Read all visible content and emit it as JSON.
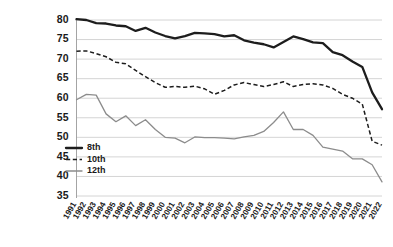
{
  "chart_data": {
    "type": "line",
    "title": "",
    "xlabel": "",
    "ylabel": "",
    "ylim": [
      35,
      80
    ],
    "ytick_step": 5,
    "grid": true,
    "legend_position": "bottom-left",
    "yticks": [
      80,
      75,
      70,
      65,
      60,
      55,
      50,
      45,
      40,
      35
    ],
    "categories": [
      "1991",
      "1992",
      "1993",
      "1994",
      "1995",
      "1996",
      "1997",
      "1998",
      "1999",
      "2000",
      "2001",
      "2002",
      "2003",
      "2004",
      "2005",
      "2006",
      "2007",
      "2008",
      "2009",
      "2010",
      "2011",
      "2012",
      "2013",
      "2014",
      "2015",
      "2016",
      "2017",
      "2018",
      "2019",
      "2020",
      "2021",
      "2022"
    ],
    "series": [
      {
        "name": "8th",
        "style": "solid-thick",
        "color": "#1d1d1d",
        "values": [
          80.2,
          80.0,
          79.2,
          79.1,
          78.6,
          78.4,
          77.2,
          78.0,
          76.8,
          75.9,
          75.3,
          75.9,
          76.7,
          76.6,
          76.4,
          75.8,
          76.1,
          74.8,
          74.2,
          73.8,
          73.0,
          74.4,
          75.8,
          75.1,
          74.3,
          74.1,
          71.8,
          71.0,
          69.4,
          68.0,
          61.5,
          57.2
        ]
      },
      {
        "name": "10th",
        "style": "dashed",
        "color": "#1d1d1d",
        "values": [
          72.0,
          72.1,
          71.4,
          70.6,
          69.2,
          68.8,
          67.1,
          65.5,
          64.0,
          62.8,
          63.0,
          62.8,
          63.1,
          62.4,
          61.0,
          62.0,
          63.4,
          64.0,
          63.5,
          63.0,
          63.5,
          64.2,
          63.0,
          63.5,
          63.7,
          63.4,
          62.5,
          61.0,
          60.0,
          58.5,
          49.0,
          48.0
        ]
      },
      {
        "name": "12th",
        "style": "solid-thin",
        "color": "#8c8c8c",
        "values": [
          59.6,
          61.0,
          60.8,
          56.0,
          54.0,
          55.5,
          53.0,
          54.5,
          52.0,
          50.0,
          49.8,
          48.6,
          50.1,
          49.9,
          49.9,
          49.8,
          49.6,
          50.1,
          50.5,
          51.5,
          53.8,
          56.5,
          52.0,
          52.0,
          50.5,
          47.5,
          47.0,
          46.5,
          44.5,
          44.5,
          43.0,
          38.6
        ]
      }
    ],
    "legend": [
      {
        "label": "8th",
        "marker": "solid-thick"
      },
      {
        "label": "10th",
        "marker": "dashed"
      },
      {
        "label": "12th",
        "marker": "solid-thin"
      }
    ]
  }
}
